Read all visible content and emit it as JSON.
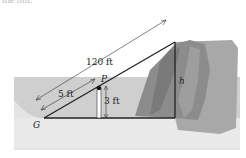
{
  "partial_heading": "the hill.",
  "diagram": {
    "labels": {
      "hypotenuse": "120 ft",
      "short_segment": "5 ft",
      "pole_height": "3 ft",
      "point_p": "P",
      "point_g": "G",
      "height": "h"
    },
    "colors": {
      "water": "#cfcfcf",
      "ground": "#e6e6e6",
      "cliff": "#9a9a9a",
      "lines": "#222222"
    }
  }
}
